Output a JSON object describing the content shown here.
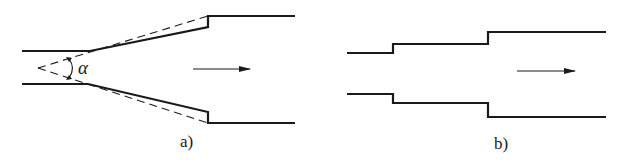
{
  "figure_a": {
    "label": "a)",
    "angle_symbol": "α",
    "type": "gradual expansion (diffuser)"
  },
  "figure_b": {
    "label": "b)",
    "type": "stepped sudden expansion"
  },
  "colors": {
    "line": "#1a1a1a",
    "background": "#ffffff"
  }
}
